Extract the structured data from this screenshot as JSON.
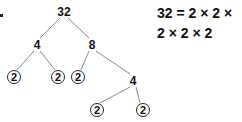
{
  "tree": {
    "root": "32",
    "level1": [
      "4",
      "8"
    ],
    "leaves_of_4": [
      "2",
      "2"
    ],
    "children_of_8": [
      "2",
      "4"
    ],
    "leaves_of_inner_4": [
      "2",
      "2"
    ]
  },
  "equation": {
    "line1": "32 = 2 × 2 ×",
    "line2": "2 × 2 × 2"
  },
  "colors": {
    "line": "#888888",
    "text": "#111111"
  }
}
